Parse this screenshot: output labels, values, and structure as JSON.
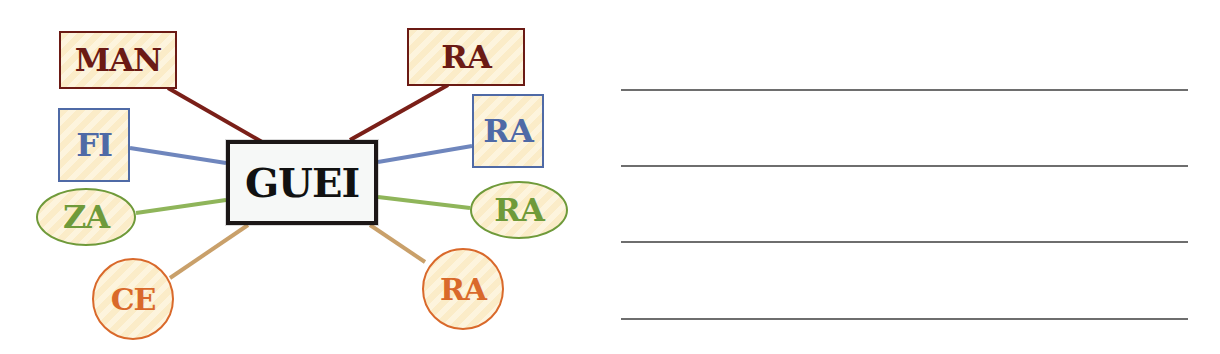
{
  "diagram": {
    "center": {
      "label": "GUEI"
    },
    "nodes": [
      {
        "id": "man",
        "label": "MAN",
        "shape": "rect",
        "color": "#6b1a14"
      },
      {
        "id": "fi",
        "label": "FI",
        "shape": "rect",
        "color": "#4f6aa6"
      },
      {
        "id": "za",
        "label": "ZA",
        "shape": "oval",
        "color": "#6f9a3a"
      },
      {
        "id": "ce",
        "label": "CE",
        "shape": "circle",
        "color": "#d9692b"
      },
      {
        "id": "ra1",
        "label": "RA",
        "shape": "rect",
        "color": "#6b1a14"
      },
      {
        "id": "ra2",
        "label": "RA",
        "shape": "rect",
        "color": "#4f6aa6"
      },
      {
        "id": "ra3",
        "label": "RA",
        "shape": "oval",
        "color": "#6f9a3a"
      },
      {
        "id": "ra4",
        "label": "RA",
        "shape": "circle",
        "color": "#d9692b"
      }
    ]
  },
  "answer_lines": {
    "count": 4
  }
}
